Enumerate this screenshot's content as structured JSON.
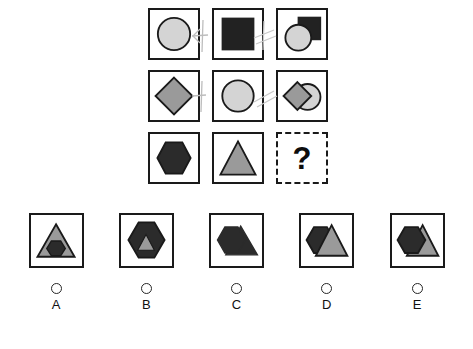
{
  "puzzle": {
    "type": "visual-analogy-matrix",
    "grid": {
      "rows": 3,
      "cols": 3,
      "cells": [
        {
          "id": "r1c1",
          "shapes": [
            {
              "name": "circle",
              "fill": "#d4d4d4",
              "stroke": "#1a1a1a"
            }
          ]
        },
        {
          "id": "r1c2",
          "shapes": [
            {
              "name": "square",
              "fill": "#222222",
              "stroke": "#222222"
            }
          ]
        },
        {
          "id": "r1c3",
          "shapes": [
            {
              "name": "square",
              "fill": "#222222",
              "stroke": "#222222"
            },
            {
              "name": "circle",
              "fill": "#d4d4d4",
              "stroke": "#1a1a1a"
            }
          ]
        },
        {
          "id": "r2c1",
          "shapes": [
            {
              "name": "diamond",
              "fill": "#9a9a9a",
              "stroke": "#1a1a1a"
            }
          ]
        },
        {
          "id": "r2c2",
          "shapes": [
            {
              "name": "circle",
              "fill": "#d4d4d4",
              "stroke": "#1a1a1a"
            }
          ]
        },
        {
          "id": "r2c3",
          "shapes": [
            {
              "name": "circle",
              "fill": "#d4d4d4",
              "stroke": "#1a1a1a"
            },
            {
              "name": "diamond",
              "fill": "#9a9a9a",
              "stroke": "#1a1a1a"
            }
          ]
        },
        {
          "id": "r3c1",
          "shapes": [
            {
              "name": "hexagon",
              "fill": "#2b2b2b",
              "stroke": "#1a1a1a"
            }
          ]
        },
        {
          "id": "r3c2",
          "shapes": [
            {
              "name": "triangle",
              "fill": "#9a9a9a",
              "stroke": "#1a1a1a"
            }
          ]
        },
        {
          "id": "r3c3",
          "shapes": [],
          "missing": true,
          "label": "?"
        }
      ]
    },
    "missing_cell_label": "?",
    "answer_options": [
      {
        "letter": "A",
        "description": "gray triangle containing small dark hexagon",
        "selected": false
      },
      {
        "letter": "B",
        "description": "dark hexagon containing small gray triangle",
        "selected": false
      },
      {
        "letter": "C",
        "description": "dark hexagon overlapping dark triangle",
        "selected": false
      },
      {
        "letter": "D",
        "description": "dark hexagon behind gray triangle, overlapping",
        "selected": false
      },
      {
        "letter": "E",
        "description": "dark hexagon in front of gray triangle, overlapping",
        "selected": false
      }
    ],
    "colors": {
      "light_gray": "#d4d4d4",
      "mid_gray": "#9a9a9a",
      "dark": "#2b2b2b",
      "black": "#222222",
      "outline": "#1a1a1a",
      "scribble": "#b8b8b8",
      "background": "#ffffff"
    }
  }
}
